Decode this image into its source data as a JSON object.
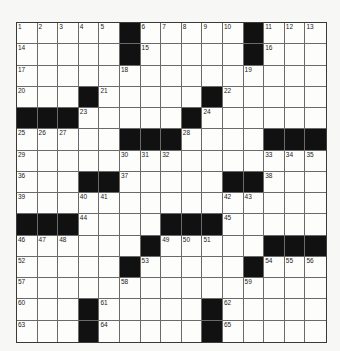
{
  "puzzle": {
    "rows": 15,
    "cols": 15,
    "colors": {
      "block": "#111111",
      "cell": "#fdfdfb",
      "line": "#6a6a6a",
      "background": "#f7f7f5"
    },
    "grid": [
      "11111011111011 1",
      "x"
    ],
    "layout": [
      ".....#.....#...",
      ".....#.....#...",
      "...............",
      "...#.....#.....",
      "###.....#......",
      ".....###....###",
      "...............",
      "...##.....##...",
      "...............",
      "###....###.....",
      "......#.....###",
      ".....#.....#...",
      "...............",
      "...#.....#.....",
      "...#.....#....."
    ],
    "numbers": [
      [
        1,
        2,
        3,
        4,
        5,
        0,
        6,
        7,
        8,
        9,
        10,
        0,
        11,
        12,
        13
      ],
      [
        14,
        0,
        0,
        0,
        0,
        0,
        15,
        0,
        0,
        0,
        0,
        0,
        16,
        0,
        0
      ],
      [
        17,
        0,
        0,
        0,
        0,
        18,
        0,
        0,
        0,
        0,
        0,
        19,
        0,
        0,
        0
      ],
      [
        20,
        0,
        0,
        0,
        21,
        0,
        0,
        0,
        0,
        0,
        22,
        0,
        0,
        0,
        0
      ],
      [
        0,
        0,
        0,
        23,
        0,
        0,
        0,
        0,
        0,
        24,
        0,
        0,
        0,
        0,
        0
      ],
      [
        25,
        26,
        27,
        0,
        0,
        0,
        0,
        0,
        28,
        0,
        0,
        0,
        0,
        0,
        0
      ],
      [
        29,
        0,
        0,
        0,
        0,
        30,
        31,
        32,
        0,
        0,
        0,
        0,
        33,
        34,
        35
      ],
      [
        36,
        0,
        0,
        0,
        0,
        37,
        0,
        0,
        0,
        0,
        0,
        0,
        38,
        0,
        0
      ],
      [
        39,
        0,
        0,
        40,
        41,
        0,
        0,
        0,
        0,
        0,
        42,
        43,
        0,
        0,
        0
      ],
      [
        0,
        0,
        0,
        44,
        0,
        0,
        0,
        0,
        0,
        0,
        45,
        0,
        0,
        0,
        0
      ],
      [
        46,
        47,
        48,
        0,
        0,
        0,
        0,
        49,
        50,
        51,
        0,
        0,
        0,
        0,
        0
      ],
      [
        52,
        0,
        0,
        0,
        0,
        0,
        53,
        0,
        0,
        0,
        0,
        0,
        54,
        55,
        56
      ],
      [
        57,
        0,
        0,
        0,
        0,
        58,
        0,
        0,
        0,
        0,
        0,
        59,
        0,
        0,
        0
      ],
      [
        60,
        0,
        0,
        0,
        61,
        0,
        0,
        0,
        0,
        0,
        62,
        0,
        0,
        0,
        0
      ],
      [
        63,
        0,
        0,
        0,
        64,
        0,
        0,
        0,
        0,
        0,
        65,
        0,
        0,
        0,
        0
      ]
    ]
  }
}
